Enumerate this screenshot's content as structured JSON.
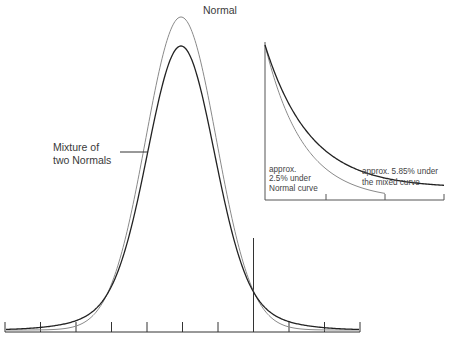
{
  "chart_data": {
    "type": "line",
    "title": "",
    "xlabel": "",
    "ylabel": "",
    "grid": false,
    "main_plot": {
      "x_ticks_count": 11,
      "x_tick_labels": [],
      "series": [
        {
          "name": "Normal",
          "description": "Standard normal density, taller and narrower peak",
          "peak_relative": 1.0
        },
        {
          "name": "Mixture of two Normals",
          "description": "Mixture density with lower peak and heavier tails",
          "peak_relative": 0.9
        }
      ],
      "cutoff_line": {
        "tick_index": 7,
        "description": "vertical line marking the upper tail cutoff"
      }
    },
    "inset": {
      "description": "Magnified view of the right tail beyond the cutoff",
      "x_ticks_count": 4,
      "series": [
        {
          "name": "Normal curve",
          "tail_area_label": "approx. 2.5% under Normal curve",
          "tail_area_pct": 2.5
        },
        {
          "name": "the mixed curve",
          "tail_area_label": "approx. 5.85% under the mixed curve",
          "tail_area_pct": 5.85
        }
      ]
    },
    "annotations": [
      "Normal",
      "Mixture of two Normals",
      "approx. 2.5% under Normal curve",
      "approx. 5.85% under the mixed curve"
    ]
  },
  "labels": {
    "normal": "Normal",
    "mixture_line1": "Mixture of",
    "mixture_line2": "two Normals",
    "inset_normal_line1": "approx.",
    "inset_normal_line2": "2.5% under",
    "inset_normal_line3": "Normal curve",
    "inset_mixed_line1": "approx. 5.85% under",
    "inset_mixed_line2": "the mixed curve"
  },
  "colors": {
    "normal_curve": "#8a8a8a",
    "mixture_curve": "#222222",
    "axis": "#333333"
  }
}
